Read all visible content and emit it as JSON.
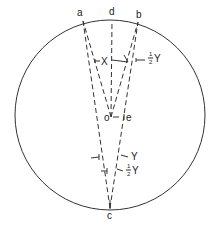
{
  "diagram": {
    "circle": {
      "cx": 110,
      "cy": 115,
      "r": 95
    },
    "points": {
      "a": {
        "label": "a",
        "x": 83,
        "y": 21
      },
      "d": {
        "label": "d",
        "x": 112,
        "y": 20
      },
      "b": {
        "label": "b",
        "x": 138,
        "y": 22
      },
      "o": {
        "label": "o",
        "x": 111,
        "y": 117
      },
      "e": {
        "label": "e",
        "x": 129,
        "y": 117
      },
      "c": {
        "label": "c",
        "x": 110,
        "y": 209
      }
    },
    "angle_labels": {
      "x": "X",
      "half_y_top": "Y",
      "y_bottom": "Y",
      "half_y_bottom": "Y",
      "half_num": "1",
      "half_den": "2"
    },
    "colors": {
      "line": "#333333",
      "background": "#ffffff"
    }
  }
}
